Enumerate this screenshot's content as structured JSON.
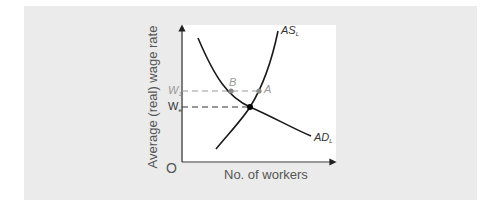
{
  "diagram": {
    "y_axis_label": "Average (real) wage rate",
    "x_axis_label": "No. of workers",
    "origin_label": "O",
    "curves": {
      "supply": {
        "label": "AS",
        "subscript": "L"
      },
      "demand": {
        "label": "AD",
        "subscript": "L"
      }
    },
    "wage_levels": {
      "w1": {
        "label": "W",
        "subscript": "1"
      },
      "we": {
        "label": "W",
        "subscript": "e"
      }
    },
    "points": {
      "a": "A",
      "b": "B"
    },
    "colors": {
      "panel_bg": "#ebebeb",
      "plot_bg": "#ffffff",
      "curve": "#1a1a1a",
      "dashed_w1": "#999999",
      "dashed_we": "#333333",
      "point_grey": "#888888",
      "equilibrium": "#000000"
    }
  }
}
